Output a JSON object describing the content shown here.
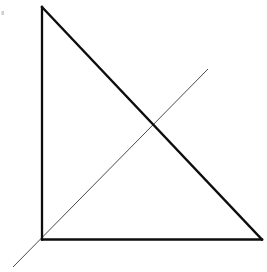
{
  "figure": {
    "background_color": "#ffffff",
    "width": 267,
    "height": 272,
    "stroke_color_primary": "#0d0d0d",
    "stroke_color_secondary": "#4a4a4a",
    "stroke_color_artifact": "#cfcfcf",
    "shapes": {
      "triangle": {
        "name": "right-triangle",
        "stroke_width": 2.3,
        "fill": "none",
        "vertices": [
          {
            "label": "apex",
            "x": 42,
            "y": 7
          },
          {
            "label": "bottom-left",
            "x": 42,
            "y": 239.5
          },
          {
            "label": "bottom-right",
            "x": 262,
            "y": 239.5
          }
        ],
        "edges": [
          {
            "label": "vertical-leg",
            "from": "apex",
            "to": "bottom-left"
          },
          {
            "label": "horizontal-leg",
            "from": "bottom-left",
            "to": "bottom-right"
          },
          {
            "label": "hypotenuse",
            "from": "apex",
            "to": "bottom-right"
          }
        ]
      },
      "ray": {
        "name": "diagonal-ray",
        "stroke_width": 1,
        "from": {
          "x": 13,
          "y": 267
        },
        "to": {
          "x": 208,
          "y": 69
        }
      },
      "artifact": {
        "name": "corner-speck",
        "x": 1.5,
        "y": 11,
        "width": 2.5,
        "height": 4
      }
    },
    "intersection": {
      "label": "crossing-point",
      "x": 157,
      "y": 123
    }
  }
}
